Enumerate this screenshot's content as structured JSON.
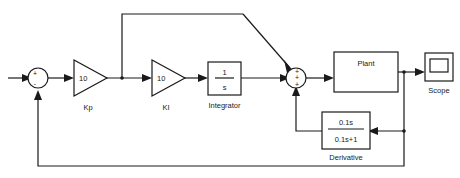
{
  "diagram": {
    "colors": {
      "line": "#1a1a1a",
      "background": "#ffffff",
      "text": "#1a1a1a"
    },
    "input": {
      "name": "reference-input-arrow"
    },
    "sum1": {
      "name": "summing-junction-error",
      "signs": [
        "+",
        "-"
      ],
      "plus": "+",
      "minus": "-"
    },
    "kp": {
      "gain": "10",
      "label": "Kp"
    },
    "ki": {
      "gain": "10",
      "label": "KI"
    },
    "integrator": {
      "numerator": "1",
      "denominator": "s",
      "label": "Integrator"
    },
    "sum2": {
      "name": "summing-junction-pid",
      "signs": [
        "+",
        "+",
        "+"
      ],
      "sign_top": "+",
      "sign_mid": "+",
      "sign_bottom": "+"
    },
    "plant": {
      "label": "Plant"
    },
    "scope": {
      "label": "Scope"
    },
    "derivative": {
      "numerator": "0.1s",
      "denominator": "0.1s+1",
      "label": "Derivative"
    }
  }
}
